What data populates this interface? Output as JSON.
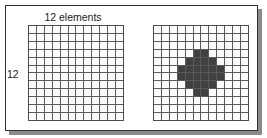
{
  "figure": {
    "title": "12 elements",
    "row_label": "12",
    "frame_border_color": "#303030",
    "shadow_color": "#8a8a8a",
    "background_color": "#ffffff"
  },
  "grids": {
    "columns": 12,
    "rows": 12,
    "cell_empty_color": "#fdfdfd",
    "cell_filled_color": "#404040",
    "gridline_color": "#5a5a5a",
    "left": {
      "name": "empty-grid",
      "filled_cells": []
    },
    "right": {
      "name": "disk-pattern-grid",
      "filled_cells": [
        [
          3,
          5
        ],
        [
          3,
          6
        ],
        [
          4,
          4
        ],
        [
          4,
          5
        ],
        [
          4,
          6
        ],
        [
          4,
          7
        ],
        [
          5,
          3
        ],
        [
          5,
          4
        ],
        [
          5,
          5
        ],
        [
          5,
          6
        ],
        [
          5,
          7
        ],
        [
          5,
          8
        ],
        [
          6,
          3
        ],
        [
          6,
          4
        ],
        [
          6,
          5
        ],
        [
          6,
          6
        ],
        [
          6,
          7
        ],
        [
          6,
          8
        ],
        [
          7,
          4
        ],
        [
          7,
          5
        ],
        [
          7,
          6
        ],
        [
          7,
          7
        ],
        [
          8,
          5
        ],
        [
          8,
          6
        ]
      ]
    }
  }
}
